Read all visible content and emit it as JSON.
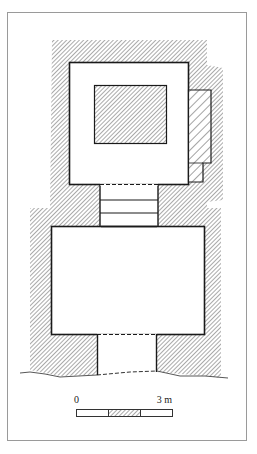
{
  "figure": {
    "type": "architectural-floor-plan",
    "frame_color": "#9a9a9a",
    "line_color": "#1a1a1a",
    "hatch_color": "#555555"
  },
  "plan": {
    "upper_chamber": {
      "label": "upper-room-with-central-block"
    },
    "annex": {
      "label": "side-annex"
    },
    "stair_passage": {
      "steps": 2
    },
    "lower_chamber": {
      "label": "lower-room"
    },
    "entrance_passage": {
      "label": "entrance"
    }
  },
  "scale_bar": {
    "start_label": "0",
    "end_label": "3 m",
    "segments": 3
  }
}
